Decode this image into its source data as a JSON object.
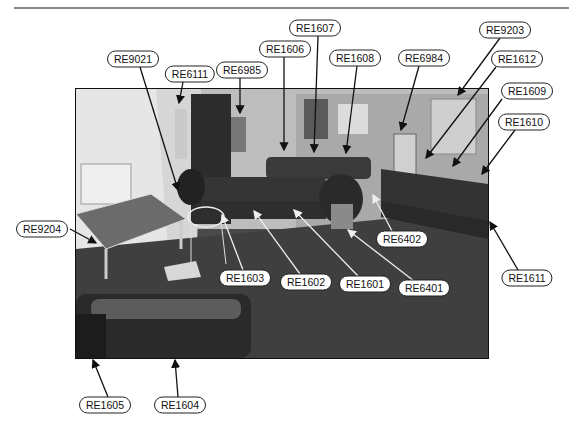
{
  "figure": {
    "labels": [
      {
        "id": "RE1607",
        "x": 315,
        "y": 28
      },
      {
        "id": "RE9203",
        "x": 505,
        "y": 30
      },
      {
        "id": "RE1606",
        "x": 285,
        "y": 49
      },
      {
        "id": "RE1608",
        "x": 355,
        "y": 58
      },
      {
        "id": "RE6984",
        "x": 424,
        "y": 58
      },
      {
        "id": "RE1612",
        "x": 517,
        "y": 59
      },
      {
        "id": "RE9021",
        "x": 133,
        "y": 59
      },
      {
        "id": "RE6111",
        "x": 190,
        "y": 74
      },
      {
        "id": "RE6985",
        "x": 242,
        "y": 70
      },
      {
        "id": "RE1609",
        "x": 527,
        "y": 91
      },
      {
        "id": "RE1610",
        "x": 524,
        "y": 122
      },
      {
        "id": "RE9204",
        "x": 42,
        "y": 229
      },
      {
        "id": "RE6402",
        "x": 402,
        "y": 239
      },
      {
        "id": "RE1603",
        "x": 245,
        "y": 278
      },
      {
        "id": "RE1602",
        "x": 306,
        "y": 282
      },
      {
        "id": "RE1601",
        "x": 365,
        "y": 284
      },
      {
        "id": "RE6401",
        "x": 424,
        "y": 288
      },
      {
        "id": "RE1611",
        "x": 527,
        "y": 278
      },
      {
        "id": "RE1605",
        "x": 105,
        "y": 405
      },
      {
        "id": "RE1604",
        "x": 180,
        "y": 405
      }
    ],
    "leaders": [
      {
        "label": "RE9021",
        "from": [
          140,
          67
        ],
        "to": [
          178,
          190
        ],
        "color": "#111"
      },
      {
        "label": "RE6111",
        "from": [
          183,
          82
        ],
        "to": [
          179,
          103
        ],
        "color": "#111"
      },
      {
        "label": "RE6985",
        "from": [
          240,
          78
        ],
        "to": [
          240,
          113
        ],
        "color": "#111"
      },
      {
        "label": "RE1606",
        "from": [
          284,
          57
        ],
        "to": [
          284,
          150
        ],
        "color": "#111"
      },
      {
        "label": "RE1607",
        "from": [
          318,
          36
        ],
        "to": [
          314,
          152
        ],
        "color": "#111"
      },
      {
        "label": "RE1608",
        "from": [
          357,
          66
        ],
        "to": [
          346,
          153
        ],
        "color": "#111"
      },
      {
        "label": "RE6984",
        "from": [
          419,
          66
        ],
        "to": [
          401,
          130
        ],
        "color": "#111"
      },
      {
        "label": "RE9203",
        "from": [
          500,
          38
        ],
        "to": [
          458,
          95
        ],
        "color": "#111"
      },
      {
        "label": "RE1612",
        "from": [
          496,
          67
        ],
        "to": [
          426,
          158
        ],
        "color": "#111"
      },
      {
        "label": "RE1609",
        "from": [
          502,
          99
        ],
        "to": [
          453,
          166
        ],
        "color": "#111"
      },
      {
        "label": "RE1610",
        "from": [
          515,
          130
        ],
        "to": [
          482,
          174
        ],
        "color": "#111"
      },
      {
        "label": "RE9204",
        "from": [
          70,
          229
        ],
        "to": [
          96,
          243
        ],
        "color": "#111"
      },
      {
        "label": "RE1611",
        "from": [
          518,
          270
        ],
        "to": [
          490,
          222
        ],
        "color": "#111"
      },
      {
        "label": "RE1605",
        "from": [
          108,
          397
        ],
        "to": [
          93,
          360
        ],
        "color": "#111"
      },
      {
        "label": "RE1604",
        "from": [
          178,
          397
        ],
        "to": [
          175,
          360
        ],
        "color": "#111"
      },
      {
        "label": "RE1603",
        "from": [
          243,
          270
        ],
        "to": [
          222,
          215
        ],
        "color": "#eee"
      },
      {
        "label": "RE1602",
        "from": [
          300,
          274
        ],
        "to": [
          254,
          211
        ],
        "color": "#eee"
      },
      {
        "label": "RE1601",
        "from": [
          358,
          276
        ],
        "to": [
          294,
          210
        ],
        "color": "#eee"
      },
      {
        "label": "RE6401",
        "from": [
          414,
          281
        ],
        "to": [
          348,
          230
        ],
        "color": "#eee"
      },
      {
        "label": "RE6402",
        "from": [
          392,
          231
        ],
        "to": [
          373,
          195
        ],
        "color": "#eee"
      }
    ]
  }
}
